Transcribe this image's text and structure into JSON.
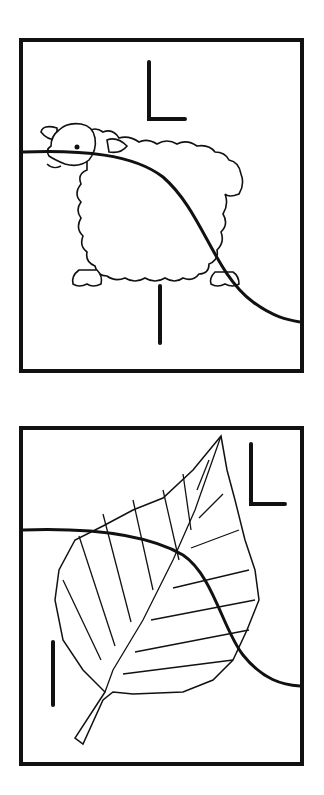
{
  "cards": [
    {
      "subject": "sheep",
      "letters": [
        "L",
        "l"
      ],
      "description": "Sheep line drawing with uppercase L and lowercase l, crossed by a curved tracing line"
    },
    {
      "subject": "leaf",
      "letters": [
        "L",
        "l"
      ],
      "description": "Leaf line drawing with uppercase L and lowercase l, crossed by a curved tracing line"
    }
  ],
  "colors": {
    "line": "#111111",
    "background": "#ffffff"
  }
}
